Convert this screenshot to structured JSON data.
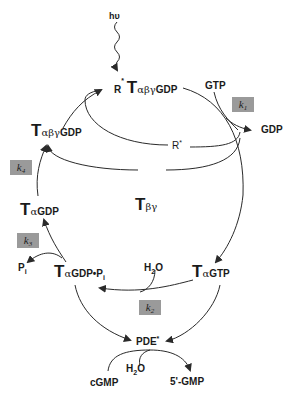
{
  "diagram": {
    "light": "hυ",
    "nodes": {
      "rstar_complex": {
        "prefix": "R",
        "sup": "*",
        "T": "T",
        "greek": "αβγ",
        "suffix": "GDP"
      },
      "t_abg_gdp": {
        "T": "T",
        "greek": "αβγ",
        "suffix": "GDP"
      },
      "t_a_gdp": {
        "T": "T",
        "greek": "α",
        "suffix": "GDP"
      },
      "t_a_gdp_pi": {
        "T": "T",
        "greek": "α",
        "suffix": "GDP•P",
        "sub": "i"
      },
      "t_a_gtp": {
        "T": "T",
        "greek": "α",
        "suffix": "GTP"
      },
      "t_bg": {
        "T": "T",
        "greek": "βγ"
      },
      "pde": {
        "label": "PDE",
        "sup": "*"
      }
    },
    "species": {
      "gtp": "GTP",
      "gdp": "GDP",
      "rstar": {
        "label": "R",
        "sup": "*"
      },
      "pi": {
        "label": "P",
        "sub": "i"
      },
      "h2o_top": {
        "pre": "H",
        "sub": "2",
        "post": "O"
      },
      "h2o_bottom": {
        "pre": "H",
        "sub": "2",
        "post": "O"
      },
      "cgmp": "cGMP",
      "gmp": "5'-GMP"
    },
    "rate_constants": [
      {
        "k": "k",
        "sub": "1"
      },
      {
        "k": "k",
        "sub": "2"
      },
      {
        "k": "k",
        "sub": "3"
      },
      {
        "k": "k",
        "sub": "4"
      }
    ],
    "colors": {
      "line": "#2a2a2a",
      "kbox": "#9a9a9a"
    }
  }
}
